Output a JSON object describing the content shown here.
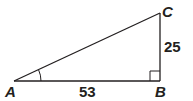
{
  "diagram": {
    "type": "right-triangle",
    "vertices": {
      "A": {
        "label": "A"
      },
      "B": {
        "label": "B"
      },
      "C": {
        "label": "C"
      }
    },
    "sides": {
      "AB": {
        "label": "53"
      },
      "BC": {
        "label": "25"
      }
    },
    "marks": {
      "right_angle_at": "B",
      "angle_arc_at": "A"
    },
    "colors": {
      "stroke": "#231f20",
      "background": "#ffffff"
    }
  }
}
